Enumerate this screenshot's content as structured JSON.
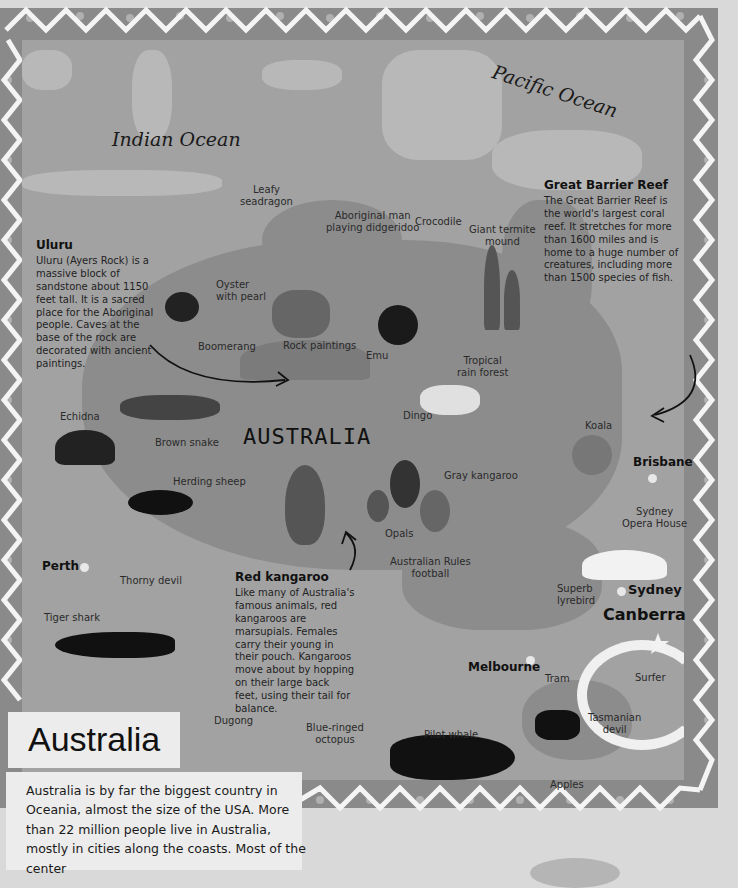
{
  "oceans": {
    "indian": "Indian Ocean",
    "pacific": "Pacific Ocean"
  },
  "country_label": "AUSTRALIA",
  "title": "Australia",
  "description": "Australia is by far the biggest country in Oceania, almost the size of the USA. More than 22 million people live in Australia, mostly in cities along the coasts. Most of the center",
  "info_boxes": {
    "uluru": {
      "title": "Uluru",
      "text": "Uluru (Ayers Rock) is a massive block of sandstone about 1150 feet tall. It is a sacred place for the Aboriginal people. Caves at the base of the rock are decorated with ancient paintings."
    },
    "reef": {
      "title": "Great Barrier Reef",
      "text": "The Great Barrier Reef is the world's largest coral reef. It stretches for more than 1600 miles and is home to a huge number of creatures, including more than 1500 species of fish."
    },
    "red_kangaroo": {
      "title": "Red kangaroo",
      "text": "Like many of Australia's famous animals, red kangaroos are marsupials. Females carry their young in their pouch. Kangaroos move about by hopping on their large back feet, using their tail for balance."
    }
  },
  "cities": {
    "perth": "Perth",
    "brisbane": "Brisbane",
    "sydney": "Sydney",
    "canberra": "Canberra",
    "melbourne": "Melbourne"
  },
  "labels": {
    "leafy_seadragon": "Leafy\nseadragon",
    "aboriginal_man": "Aboriginal man\nplaying didgeridoo",
    "crocodile": "Crocodile",
    "termite_mound": "Giant termite\nmound",
    "oyster": "Oyster\nwith pearl",
    "boomerang": "Boomerang",
    "rock_paintings": "Rock paintings",
    "emu": "Emu",
    "rain_forest": "Tropical\nrain forest",
    "echidna": "Echidna",
    "brown_snake": "Brown snake",
    "dingo": "Dingo",
    "koala": "Koala",
    "herding_sheep": "Herding sheep",
    "gray_kangaroo": "Gray kangaroo",
    "opera_house": "Sydney\nOpera House",
    "opals": "Opals",
    "thorny_devil": "Thorny devil",
    "aussie_rules": "Australian Rules\nfootball",
    "lyrebird": "Superb\nlyrebird",
    "tiger_shark": "Tiger shark",
    "tram": "Tram",
    "surfer": "Surfer",
    "dugong": "Dugong",
    "octopus": "Blue-ringed\noctopus",
    "pilot_whale": "Pilot whale",
    "tasmanian_devil": "Tasmanian\ndevil",
    "apples": "Apples"
  }
}
